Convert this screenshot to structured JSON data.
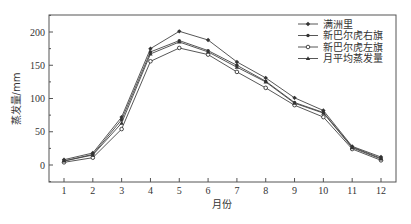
{
  "chart_data": {
    "type": "line",
    "title": "",
    "xlabel": "月份",
    "ylabel": "蒸发量/mm",
    "x": [
      1,
      2,
      3,
      4,
      5,
      6,
      7,
      8,
      9,
      10,
      11,
      12
    ],
    "xticks": [
      "1",
      "2",
      "3",
      "4",
      "5",
      "6",
      "7",
      "8",
      "9",
      "10",
      "11",
      "12"
    ],
    "yticks": [
      0,
      50,
      100,
      150,
      200
    ],
    "ylim": [
      -25,
      225
    ],
    "xlim": [
      0.5,
      12.5
    ],
    "grid": false,
    "legend_position": "upper right",
    "series": [
      {
        "name": "满洲里",
        "marker": "filled-diamond",
        "values": [
          8,
          18,
          72,
          175,
          201,
          188,
          155,
          131,
          101,
          82,
          28,
          12
        ]
      },
      {
        "name": "新巴尔虎右旗",
        "marker": "filled-dot",
        "values": [
          6,
          16,
          68,
          170,
          187,
          172,
          150,
          126,
          94,
          79,
          27,
          10
        ]
      },
      {
        "name": "新巴尔虎左旗",
        "marker": "open-circle",
        "values": [
          4,
          11,
          54,
          156,
          176,
          166,
          140,
          116,
          90,
          72,
          24,
          7
        ]
      },
      {
        "name": "月平均蒸发量",
        "marker": "filled-triangle",
        "values": [
          6,
          15,
          63,
          167,
          185,
          170,
          147,
          125,
          93,
          78,
          26,
          9
        ]
      }
    ]
  }
}
